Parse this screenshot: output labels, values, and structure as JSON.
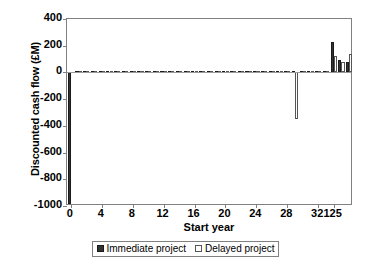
{
  "chart_data": {
    "type": "bar",
    "title": "",
    "xlabel": "Start year",
    "ylabel": "Discounted cash flow (£M)",
    "ylim": [
      -1000,
      400
    ],
    "ytick_labels": [
      "400",
      "200",
      "0",
      "-200",
      "-400",
      "-600",
      "-800",
      "-1000"
    ],
    "ytick_values": [
      400,
      200,
      0,
      -200,
      -400,
      -600,
      -800,
      -1000
    ],
    "xtick_labels": [
      "0",
      "4",
      "8",
      "12",
      "16",
      "20",
      "24",
      "28",
      "32",
      "125"
    ],
    "xtick_values": [
      0,
      4,
      8,
      12,
      16,
      20,
      24,
      28,
      32,
      125
    ],
    "axis_note": "broken x axis: compressed tail between 32 and 125",
    "grid": false,
    "legend_position": "bottom",
    "legend": [
      "Immediate project",
      "Delayed project"
    ],
    "series": [
      {
        "name": "Immediate project",
        "fill": "#333333",
        "points": [
          {
            "x": 0,
            "value": -985
          },
          {
            "x": 1,
            "value": 12
          },
          {
            "x": 2,
            "value": 12
          },
          {
            "x": 3,
            "value": 12
          },
          {
            "x": 4,
            "value": 12
          },
          {
            "x": 5,
            "value": 12
          },
          {
            "x": 6,
            "value": 12
          },
          {
            "x": 7,
            "value": 12
          },
          {
            "x": 8,
            "value": 12
          },
          {
            "x": 9,
            "value": 12
          },
          {
            "x": 10,
            "value": 12
          },
          {
            "x": 11,
            "value": 12
          },
          {
            "x": 12,
            "value": 12
          },
          {
            "x": 13,
            "value": 12
          },
          {
            "x": 14,
            "value": 12
          },
          {
            "x": 15,
            "value": 12
          },
          {
            "x": 16,
            "value": 12
          },
          {
            "x": 17,
            "value": 12
          },
          {
            "x": 18,
            "value": 12
          },
          {
            "x": 19,
            "value": 12
          },
          {
            "x": 20,
            "value": 12
          },
          {
            "x": 21,
            "value": 12
          },
          {
            "x": 22,
            "value": 12
          },
          {
            "x": 23,
            "value": 12
          },
          {
            "x": 24,
            "value": 12
          },
          {
            "x": 25,
            "value": 12
          },
          {
            "x": 26,
            "value": 12
          },
          {
            "x": 27,
            "value": 12
          },
          {
            "x": 28,
            "value": 12
          },
          {
            "x": 29,
            "value": 12
          },
          {
            "x": 30,
            "value": 12
          },
          {
            "x": 31,
            "value": 12
          },
          {
            "x": 32,
            "value": 12
          },
          {
            "x": 33,
            "value": 12
          },
          {
            "x": 34,
            "value": 230
          },
          {
            "x": 35,
            "value": 90
          },
          {
            "x": 36,
            "value": 75
          }
        ]
      },
      {
        "name": "Delayed project",
        "fill": "#ffffff",
        "points": [
          {
            "x": 1,
            "value": 10
          },
          {
            "x": 2,
            "value": 10
          },
          {
            "x": 3,
            "value": 10
          },
          {
            "x": 4,
            "value": 10
          },
          {
            "x": 5,
            "value": 10
          },
          {
            "x": 6,
            "value": 10
          },
          {
            "x": 7,
            "value": 10
          },
          {
            "x": 8,
            "value": 10
          },
          {
            "x": 9,
            "value": 10
          },
          {
            "x": 10,
            "value": 10
          },
          {
            "x": 11,
            "value": 10
          },
          {
            "x": 12,
            "value": 10
          },
          {
            "x": 13,
            "value": 10
          },
          {
            "x": 14,
            "value": 10
          },
          {
            "x": 15,
            "value": 10
          },
          {
            "x": 16,
            "value": 10
          },
          {
            "x": 17,
            "value": 10
          },
          {
            "x": 18,
            "value": 10
          },
          {
            "x": 19,
            "value": 10
          },
          {
            "x": 20,
            "value": 10
          },
          {
            "x": 21,
            "value": 10
          },
          {
            "x": 22,
            "value": 10
          },
          {
            "x": 23,
            "value": 10
          },
          {
            "x": 24,
            "value": 10
          },
          {
            "x": 25,
            "value": 10
          },
          {
            "x": 26,
            "value": 10
          },
          {
            "x": 27,
            "value": 10
          },
          {
            "x": 28,
            "value": 10
          },
          {
            "x": 29,
            "value": -350
          },
          {
            "x": 30,
            "value": 10
          },
          {
            "x": 31,
            "value": 10
          },
          {
            "x": 32,
            "value": 10
          },
          {
            "x": 33,
            "value": 10
          },
          {
            "x": 34,
            "value": 125
          },
          {
            "x": 35,
            "value": 80
          },
          {
            "x": 36,
            "value": 135
          }
        ]
      }
    ]
  }
}
